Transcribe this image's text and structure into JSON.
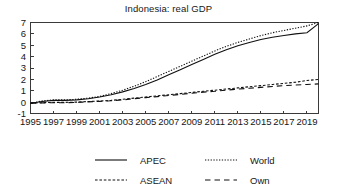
{
  "chart_data": {
    "type": "line",
    "title": "Indonesia: real GDP",
    "xlabel": "",
    "ylabel": "",
    "xlim": [
      1995,
      2020
    ],
    "ylim": [
      -1,
      7
    ],
    "grid": false,
    "legend_position": "bottom",
    "y_ticks": [
      "7",
      "6",
      "5",
      "4",
      "3",
      "2",
      "1",
      "0",
      "-1"
    ],
    "y_tick_values": [
      7,
      6,
      5,
      4,
      3,
      2,
      1,
      0,
      -1
    ],
    "x_ticks": [
      "1995",
      "1997",
      "1999",
      "2001",
      "2003",
      "2005",
      "2007",
      "2009",
      "2011",
      "2013",
      "2015",
      "2017",
      "2019"
    ],
    "x_tick_values": [
      1995,
      1997,
      1999,
      2001,
      2003,
      2005,
      2007,
      2009,
      2011,
      2013,
      2015,
      2017,
      2019
    ],
    "x": [
      1995,
      1996,
      1997,
      1998,
      1999,
      2000,
      2001,
      2002,
      2003,
      2004,
      2005,
      2006,
      2007,
      2008,
      2009,
      2010,
      2011,
      2012,
      2013,
      2014,
      2015,
      2016,
      2017,
      2018,
      2019,
      2020
    ],
    "series": [
      {
        "name": "APEC",
        "style": "solid",
        "values": [
          -0.1,
          0.05,
          0.15,
          0.15,
          0.2,
          0.3,
          0.45,
          0.65,
          0.9,
          1.2,
          1.55,
          1.95,
          2.4,
          2.85,
          3.3,
          3.75,
          4.2,
          4.6,
          4.95,
          5.25,
          5.5,
          5.7,
          5.85,
          6.0,
          6.1,
          6.9
        ]
      },
      {
        "name": "World",
        "style": "dotted",
        "values": [
          -0.1,
          0.1,
          0.2,
          0.2,
          0.25,
          0.35,
          0.5,
          0.75,
          1.05,
          1.4,
          1.8,
          2.25,
          2.7,
          3.15,
          3.6,
          4.05,
          4.5,
          4.9,
          5.25,
          5.55,
          5.85,
          6.1,
          6.3,
          6.5,
          6.7,
          7.0
        ]
      },
      {
        "name": "ASEAN",
        "style": "dash-short",
        "values": [
          -0.1,
          -0.05,
          -0.02,
          -0.02,
          0.0,
          0.05,
          0.1,
          0.15,
          0.25,
          0.35,
          0.45,
          0.55,
          0.65,
          0.75,
          0.85,
          0.95,
          1.05,
          1.15,
          1.25,
          1.35,
          1.45,
          1.55,
          1.65,
          1.75,
          1.9,
          2.0
        ]
      },
      {
        "name": "Own",
        "style": "dash-long",
        "values": [
          -0.1,
          -0.07,
          -0.05,
          -0.05,
          -0.02,
          0.02,
          0.07,
          0.12,
          0.2,
          0.3,
          0.4,
          0.48,
          0.58,
          0.68,
          0.78,
          0.88,
          0.95,
          1.05,
          1.15,
          1.22,
          1.3,
          1.38,
          1.45,
          1.5,
          1.55,
          1.6
        ]
      }
    ],
    "legend": [
      {
        "label": "APEC",
        "style": "solid"
      },
      {
        "label": "World",
        "style": "dotted"
      },
      {
        "label": "ASEAN",
        "style": "dash-short"
      },
      {
        "label": "Own",
        "style": "dash-long"
      }
    ],
    "colors": {
      "ink": "#101010",
      "axis": "#3a3a3a",
      "background": "#ffffff"
    }
  }
}
